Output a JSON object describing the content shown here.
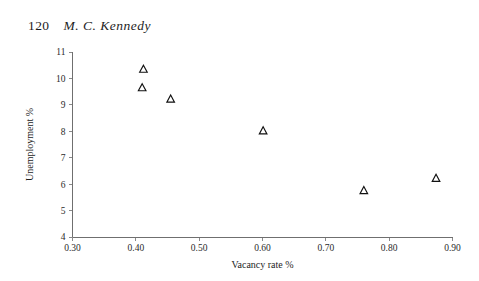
{
  "page": {
    "folio": "120",
    "running_title": "M. C. Kennedy"
  },
  "chart_data": {
    "type": "scatter",
    "title": "",
    "xlabel": "Vacancy rate %",
    "ylabel": "Unemployment %",
    "xlim": [
      0.3,
      0.9
    ],
    "ylim": [
      4,
      11
    ],
    "xticks": [
      "0.30",
      "0.40",
      "0.50",
      "0.60",
      "0.70",
      "0.80",
      "0.90"
    ],
    "xtick_values": [
      0.3,
      0.4,
      0.5,
      0.6,
      0.7,
      0.8,
      0.9
    ],
    "yticks": [
      "4",
      "5",
      "6",
      "7",
      "8",
      "9",
      "10",
      "11"
    ],
    "ytick_values": [
      4,
      5,
      6,
      7,
      8,
      9,
      10,
      11
    ],
    "grid": false,
    "legend": "none",
    "marker": "open-triangle",
    "marker_color": "#111111",
    "series": [
      {
        "name": "observations",
        "points": [
          {
            "x": 0.412,
            "y": 10.35
          },
          {
            "x": 0.41,
            "y": 9.65
          },
          {
            "x": 0.455,
            "y": 9.22
          },
          {
            "x": 0.601,
            "y": 8.02
          },
          {
            "x": 0.76,
            "y": 5.76
          },
          {
            "x": 0.874,
            "y": 6.22
          }
        ]
      }
    ]
  }
}
